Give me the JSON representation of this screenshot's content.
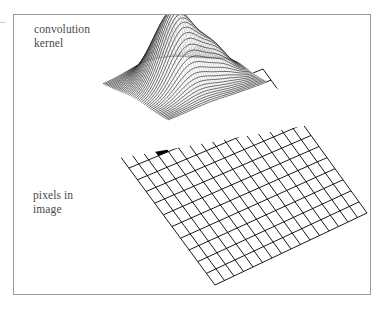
{
  "figure": {
    "background_color": "#ffffff",
    "frame_color": "#9a9a9a",
    "ink_color": "#000000",
    "caption_color": "#4a4a4a",
    "labels": {
      "kernel": "convolution\nkernel",
      "pixels": "pixels in\nimage"
    }
  },
  "chart_data": {
    "type": "surface",
    "title": "",
    "subtitle": "",
    "xlabel": "",
    "ylabel": "",
    "annotations": [
      "convolution\nkernel",
      "pixels in\nimage"
    ],
    "grid": true,
    "legend_position": "none",
    "panels": [
      {
        "name": "convolution-kernel-surface",
        "type": "surface",
        "description": "3D mesh surface of a gaussian-like convolution kernel rendered as dense hatched wireframe above a flat base plane",
        "surface_function": "gaussian",
        "peak_amplitude": 1.0,
        "peak_x": 0.42,
        "peak_y": 0.46,
        "sigma_x": 0.17,
        "sigma_y": 0.2,
        "secondary_lobe_amplitude": 0.34,
        "secondary_lobe_x": 0.74,
        "secondary_lobe_y": 0.58,
        "secondary_lobe_sigma": 0.13,
        "mesh_rows": 44,
        "mesh_cols": 44,
        "base_plane_cells": 16,
        "zlim": [
          0,
          1
        ],
        "xlim": [
          0,
          1
        ],
        "ylim": [
          0,
          1
        ],
        "projection_quad": [
          [
            103.0,
            84.0
          ],
          [
            200.0,
            45.0
          ],
          [
            267.0,
            82.0
          ],
          [
            168.0,
            120.0
          ]
        ],
        "elev_deg": 32,
        "azim_deg": -38
      },
      {
        "name": "image-pixel-grid",
        "type": "grid",
        "description": "Tilted rectangular lattice representing the pixels of an image; one cell is filled solid black marking the pixel under the kernel centre",
        "columns": 16,
        "rows": 13,
        "quad": [
          [
            103.0,
            133.0
          ],
          [
            263.0,
            69.0
          ],
          [
            367.0,
            213.0
          ],
          [
            215.0,
            285.0
          ]
        ],
        "line_color": "#000000",
        "line_width": 0.9,
        "highlight_cell": {
          "col": 3,
          "row": 2,
          "fill": "#000000"
        },
        "marker_cell": {
          "col": 9,
          "row": 1
        }
      }
    ],
    "connectors": {
      "style": "dotted",
      "color": "#b4b4b4",
      "lines": [
        {
          "from": [
            103.0,
            84.0
          ],
          "to": [
            103.0,
            133.0
          ]
        },
        {
          "from": [
            168.0,
            120.0
          ],
          "to": [
            168.0,
            133.0
          ]
        },
        {
          "from": [
            199.0,
            72.0
          ],
          "to": [
            214.0,
            150.0
          ]
        }
      ]
    }
  }
}
